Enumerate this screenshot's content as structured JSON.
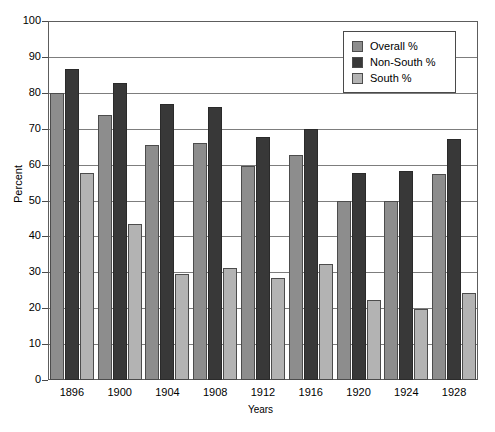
{
  "chart_data": {
    "type": "bar",
    "title": "",
    "xlabel": "Years",
    "ylabel": "Percent",
    "ylim": [
      0,
      100
    ],
    "ytick_step": 10,
    "yticks": [
      0,
      10,
      20,
      30,
      40,
      50,
      60,
      70,
      80,
      90,
      100
    ],
    "grid": true,
    "legend_position": "top-right",
    "categories": [
      "1896",
      "1900",
      "1904",
      "1908",
      "1912",
      "1916",
      "1920",
      "1924",
      "1928"
    ],
    "series": [
      {
        "name": "Overall %",
        "color": "#8d8d8d",
        "values": [
          80.0,
          73.9,
          65.4,
          66.0,
          59.6,
          62.7,
          49.9,
          49.9,
          57.3
        ]
      },
      {
        "name": "Non-South %",
        "color": "#383838",
        "values": [
          86.6,
          82.6,
          76.8,
          76.1,
          67.7,
          69.8,
          57.7,
          58.2,
          67.0
        ]
      },
      {
        "name": "South %",
        "color": "#b3b3b3",
        "values": [
          57.6,
          43.5,
          29.4,
          31.3,
          28.3,
          32.3,
          22.3,
          19.8,
          24.1
        ]
      }
    ]
  },
  "legend": {
    "items": [
      {
        "label": "Overall %",
        "color": "#8d8d8d"
      },
      {
        "label": "Non-South %",
        "color": "#383838"
      },
      {
        "label": "South %",
        "color": "#b3b3b3"
      }
    ]
  },
  "axes": {
    "y_title": "Percent",
    "x_title": "Years"
  }
}
